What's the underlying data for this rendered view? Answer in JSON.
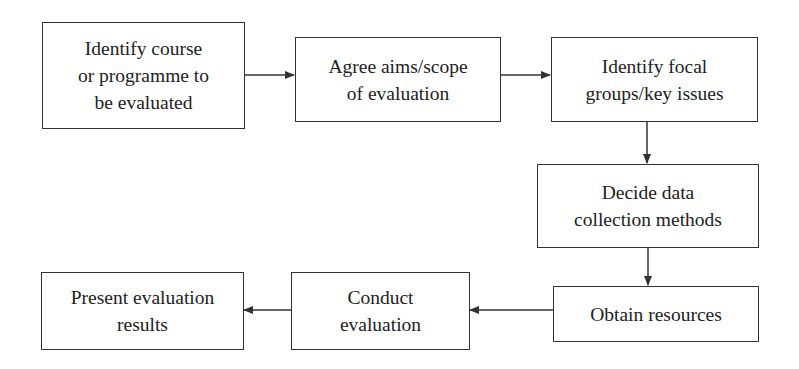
{
  "diagram": {
    "type": "flowchart",
    "nodes": [
      {
        "id": "identify-course",
        "lines": [
          "Identify course",
          "or programme to",
          "be evaluated"
        ]
      },
      {
        "id": "agree-aims",
        "lines": [
          "Agree aims/scope",
          "of evaluation"
        ]
      },
      {
        "id": "identify-focal",
        "lines": [
          "Identify focal",
          "groups/key issues"
        ]
      },
      {
        "id": "decide-methods",
        "lines": [
          "Decide data",
          "collection methods"
        ]
      },
      {
        "id": "obtain-resources",
        "lines": [
          "Obtain resources"
        ]
      },
      {
        "id": "conduct-evaluation",
        "lines": [
          "Conduct",
          "evaluation"
        ]
      },
      {
        "id": "present-results",
        "lines": [
          "Present evaluation",
          "results"
        ]
      }
    ],
    "edges": [
      {
        "from": "identify-course",
        "to": "agree-aims"
      },
      {
        "from": "agree-aims",
        "to": "identify-focal"
      },
      {
        "from": "identify-focal",
        "to": "decide-methods"
      },
      {
        "from": "decide-methods",
        "to": "obtain-resources"
      },
      {
        "from": "obtain-resources",
        "to": "conduct-evaluation"
      },
      {
        "from": "conduct-evaluation",
        "to": "present-results"
      }
    ],
    "line_color": "#333333"
  }
}
